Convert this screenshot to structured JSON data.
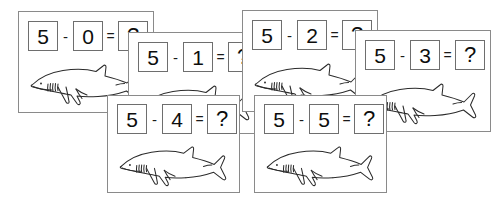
{
  "worksheet": {
    "title": "Shark subtraction flashcards",
    "background_color": "#ffffff",
    "card_border_color": "#8a8a8a",
    "box_border_color": "#6e6e6e",
    "text_color": "#0d0d0d",
    "operator_minus": "-",
    "operator_equals": "=",
    "answer_placeholder": "?",
    "illustration": "shark-line-drawing"
  },
  "cards": [
    {
      "id": "card-1",
      "minuend": "5",
      "operator": "-",
      "subtrahend": "0",
      "equals": "=",
      "answer": "?",
      "x": 18,
      "y": 11,
      "w": 136,
      "h": 102,
      "eq_x": 9,
      "eq_y": 9,
      "shark_x": 8,
      "shark_y": 44,
      "shark_w": 122,
      "shark_h": 50,
      "z": 1
    },
    {
      "id": "card-2",
      "minuend": "5",
      "operator": "-",
      "subtrahend": "1",
      "equals": "=",
      "answer": "?",
      "x": 128,
      "y": 32,
      "w": 136,
      "h": 102,
      "eq_x": 9,
      "eq_y": 9,
      "shark_x": 8,
      "shark_y": 44,
      "shark_w": 122,
      "shark_h": 50,
      "z": 2
    },
    {
      "id": "card-3",
      "minuend": "5",
      "operator": "-",
      "subtrahend": "2",
      "equals": "=",
      "answer": "?",
      "x": 242,
      "y": 10,
      "w": 136,
      "h": 102,
      "eq_x": 9,
      "eq_y": 9,
      "shark_x": 8,
      "shark_y": 44,
      "shark_w": 122,
      "shark_h": 50,
      "z": 3
    },
    {
      "id": "card-4",
      "minuend": "5",
      "operator": "-",
      "subtrahend": "3",
      "equals": "=",
      "answer": "?",
      "x": 355,
      "y": 30,
      "w": 136,
      "h": 102,
      "eq_x": 9,
      "eq_y": 9,
      "shark_x": 8,
      "shark_y": 44,
      "shark_w": 122,
      "shark_h": 50,
      "z": 4
    },
    {
      "id": "card-5",
      "minuend": "5",
      "operator": "-",
      "subtrahend": "4",
      "equals": "=",
      "answer": "?",
      "x": 107,
      "y": 95,
      "w": 133,
      "h": 98,
      "eq_x": 9,
      "eq_y": 8,
      "shark_x": 8,
      "shark_y": 42,
      "shark_w": 120,
      "shark_h": 49,
      "z": 5
    },
    {
      "id": "card-6",
      "minuend": "5",
      "operator": "-",
      "subtrahend": "5",
      "equals": "=",
      "answer": "?",
      "x": 254,
      "y": 95,
      "w": 133,
      "h": 98,
      "eq_x": 9,
      "eq_y": 8,
      "shark_x": 8,
      "shark_y": 42,
      "shark_w": 120,
      "shark_h": 49,
      "z": 6
    }
  ]
}
